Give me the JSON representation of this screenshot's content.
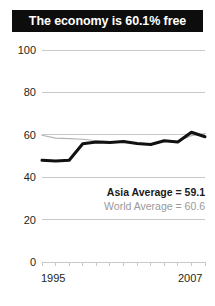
{
  "title": "The economy is 60.1% free",
  "legend": {
    "asia": "Asia Average = 59.1",
    "world": "World Average = 60.6"
  },
  "axis": {
    "x_start_label": "1995",
    "x_end_label": "2007",
    "y_ticks": [
      "100",
      "80",
      "60",
      "40",
      "20",
      "0"
    ]
  },
  "colors": {
    "banner_bg": "#0d0d0d",
    "banner_text": "#ffffff",
    "asia_line": "#111111",
    "world_line": "#b3b3b3",
    "gridline": "#c9c9c9",
    "axis_text": "#231f20",
    "world_text": "#9a9a9a"
  },
  "chart_data": {
    "type": "line",
    "title": "The economy is 60.1% free",
    "xlabel": "",
    "ylabel": "",
    "xlim": [
      1995,
      2007
    ],
    "ylim": [
      0,
      100
    ],
    "grid": true,
    "legend_position": "inside-right",
    "x": [
      1995,
      1996,
      1997,
      1998,
      1999,
      2000,
      2001,
      2002,
      2003,
      2004,
      2005,
      2006,
      2007
    ],
    "yticks": [
      0,
      20,
      40,
      60,
      80,
      100
    ],
    "xticks": [
      1995,
      1996,
      1997,
      1998,
      1999,
      2000,
      2001,
      2002,
      2003,
      2004,
      2005,
      2006,
      2007
    ],
    "series": [
      {
        "name": "Asia Average = 59.1",
        "label": "Asia Average",
        "value": 59.1,
        "color": "#111111",
        "linewidth": 3,
        "values": [
          48.0,
          47.6,
          48.0,
          55.8,
          56.6,
          56.4,
          56.8,
          55.9,
          55.4,
          57.2,
          56.6,
          61.2,
          59.1
        ]
      },
      {
        "name": "World Average = 60.6",
        "label": "World Average",
        "value": 60.6,
        "color": "#b3b3b3",
        "linewidth": 1.2,
        "values": [
          59.8,
          58.4,
          58.2,
          57.9,
          57.2,
          56.8,
          56.4,
          55.7,
          55.6,
          56.8,
          57.0,
          59.6,
          60.6
        ]
      }
    ],
    "annotations": [
      {
        "text": "Asia Average = 59.1",
        "style": "bold"
      },
      {
        "text": "World Average = 60.6",
        "style": "muted"
      }
    ]
  }
}
